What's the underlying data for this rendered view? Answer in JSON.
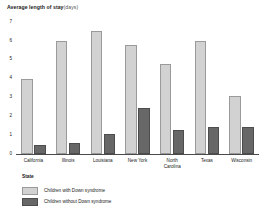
{
  "title": {
    "main": "Average length of stay",
    "units": "(days)"
  },
  "legend": {
    "heading": "State",
    "entries": [
      {
        "label": "Children with Down syndrome",
        "color": "#d2d2d2",
        "swatch": "light"
      },
      {
        "label": "Children without Down syndrome",
        "color": "#676767",
        "swatch": "dark"
      }
    ]
  },
  "chart_data": {
    "type": "bar",
    "xlabel": "State",
    "ylabel": "Average length of stay (days)",
    "categories": [
      "California",
      "Illinois",
      "Louisiana",
      "New York",
      "North Carolina",
      "Texas",
      "Wisconsin"
    ],
    "series": [
      {
        "name": "Children with Down syndrome",
        "color": "#d2d2d2",
        "values": [
          4.0,
          6.0,
          6.5,
          5.8,
          4.8,
          6.0,
          3.1
        ]
      },
      {
        "name": "Children without Down syndrome",
        "color": "#676767",
        "values": [
          0.5,
          0.6,
          1.05,
          2.45,
          1.25,
          1.45,
          1.45
        ]
      }
    ],
    "ylim": [
      0,
      7
    ],
    "yticks": [
      0,
      1,
      2,
      3,
      4,
      5,
      6,
      7
    ],
    "ytick_labels": [
      "0",
      "1",
      "2",
      "3",
      "4",
      "5",
      "6",
      "7"
    ],
    "grid": false,
    "legend_position": "bottom-left"
  }
}
